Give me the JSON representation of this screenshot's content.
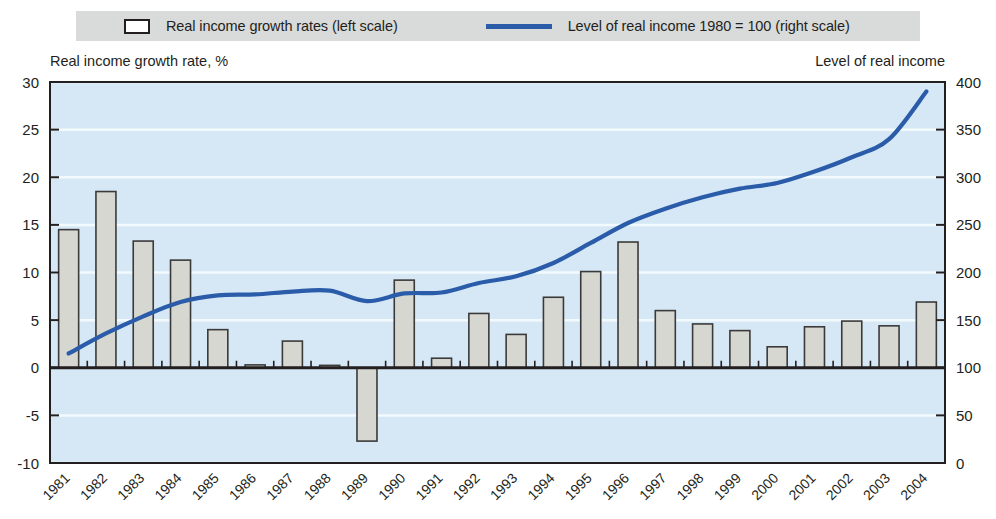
{
  "legend": {
    "bars_label": "Real income growth rates (left scale)",
    "line_label": "Level of real income 1980 = 100 (right scale)",
    "bar_swatch_name": "bar-swatch",
    "line_swatch_name": "line-swatch"
  },
  "axes": {
    "left_caption": "Real income growth rate, %",
    "right_caption": "Level of real income",
    "left_ticks": [
      "30",
      "25",
      "20",
      "15",
      "10",
      "5",
      "0",
      "-5",
      "-10"
    ],
    "right_ticks": [
      "400",
      "350",
      "300",
      "250",
      "200",
      "150",
      "100",
      "50",
      "0"
    ]
  },
  "colors": {
    "plot_background": "#d6e8f5",
    "line": "#2a5caa",
    "bar_fill": "#d7d7d2",
    "bar_stroke": "#3a3a3a",
    "axis": "#231f20",
    "legend_background": "#d9dada",
    "gridline": "#f2fafe"
  },
  "chart_data": {
    "type": "bar",
    "title": "",
    "xlabel": "",
    "ylabel": "Real income growth rate, %",
    "ylabel_right": "Level of real income",
    "ylim": [
      -10,
      30
    ],
    "ylim_right": [
      0,
      400
    ],
    "grid": true,
    "legend_position": "top",
    "categories": [
      "1981",
      "1982",
      "1983",
      "1984",
      "1985",
      "1986",
      "1987",
      "1988",
      "1989",
      "1990",
      "1991",
      "1992",
      "1993",
      "1994",
      "1995",
      "1996",
      "1997",
      "1998",
      "1999",
      "2000",
      "2001",
      "2002",
      "2003",
      "2004"
    ],
    "series": [
      {
        "name": "Real income growth rates (left scale)",
        "type": "bar",
        "axis": "left",
        "values": [
          14.5,
          18.5,
          13.3,
          11.3,
          4.0,
          0.3,
          2.8,
          0.25,
          -7.7,
          9.2,
          1.0,
          5.7,
          3.5,
          7.4,
          10.1,
          13.2,
          6.0,
          4.6,
          3.9,
          2.2,
          4.3,
          4.9,
          4.4,
          6.9
        ]
      },
      {
        "name": "Level of real income 1980 = 100 (right scale)",
        "type": "line",
        "axis": "right",
        "values": [
          115,
          136,
          154,
          169,
          176,
          177,
          180,
          181,
          170,
          178,
          179,
          189,
          196,
          210,
          231,
          252,
          267,
          279,
          288,
          294,
          306,
          321,
          340,
          390
        ]
      }
    ]
  }
}
